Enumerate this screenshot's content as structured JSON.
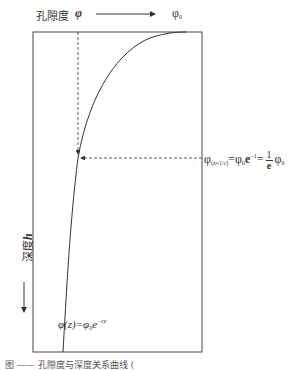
{
  "diagram": {
    "axis_label_porosity": "孔隙度",
    "phi_symbol": "φ",
    "phi0_label": "φ",
    "phi0_sub": "0",
    "depth_label": "深度",
    "depth_var": "h",
    "annotation": {
      "lhs_phi": "φ",
      "lhs_sub": "(z=1/c)",
      "eq1": "=φ",
      "eq1_sub": "0",
      "eq1_e": "e",
      "eq1_exp": "−1",
      "eq2": "=",
      "frac_num": "1",
      "frac_den": "e",
      "rhs_phi": "φ",
      "rhs_sub": "0"
    },
    "formula": {
      "lhs": "φ(z)=φ",
      "sub": "0",
      "e": "e",
      "exp": "−cz"
    },
    "caption": "图 —— 孔隙度与深度关系曲线 ("
  }
}
